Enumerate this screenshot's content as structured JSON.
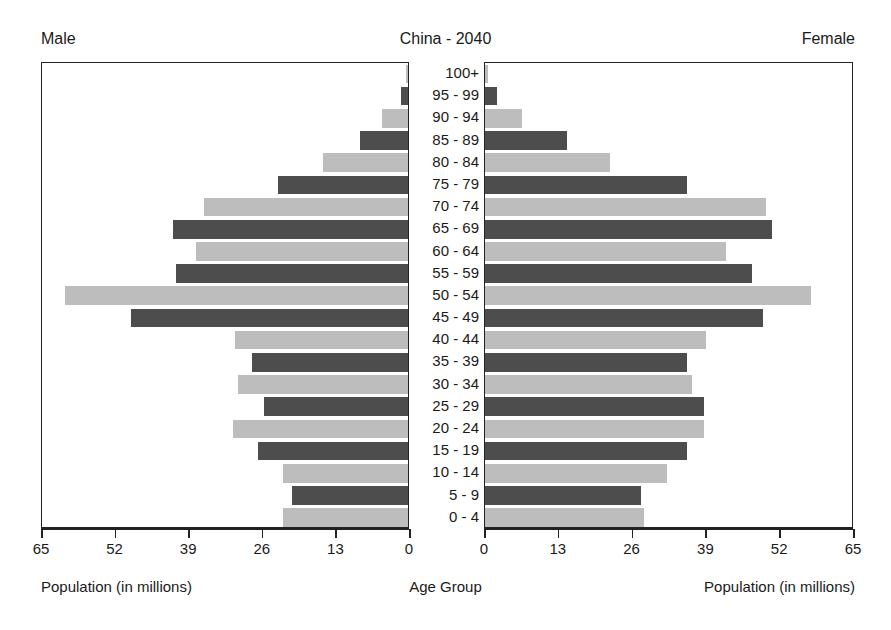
{
  "header": {
    "male_label": "Male",
    "female_label": "Female",
    "title": "China - 2040"
  },
  "footer": {
    "left_caption": "Population (in millions)",
    "center_caption": "Age Group",
    "right_caption": "Population (in millions)"
  },
  "colors": {
    "bar_dark": "#4d4d4d",
    "bar_light": "#bdbdbd",
    "axis": "#222222",
    "text": "#1a1a1a",
    "background": "#ffffff"
  },
  "axis": {
    "left_ticks": [
      "65",
      "52",
      "39",
      "26",
      "13",
      "0"
    ],
    "right_ticks": [
      "0",
      "13",
      "26",
      "39",
      "52",
      "65"
    ],
    "max": 65,
    "tick_step": 13
  },
  "chart_data": {
    "type": "bar",
    "subtype": "population-pyramid",
    "title": "China - 2040",
    "xlabel": "Population (in millions)",
    "ylabel": "Age Group",
    "xlim": [
      0,
      65
    ],
    "grid": false,
    "legend": [
      "Male",
      "Female"
    ],
    "legend_position": "top-corners",
    "categories": [
      "100+",
      "95 - 99",
      "90 - 94",
      "85 - 89",
      "80 - 84",
      "75 - 79",
      "70 - 74",
      "65 - 69",
      "60 - 64",
      "55 - 59",
      "50 - 54",
      "45 - 49",
      "40 - 44",
      "35 - 39",
      "30 - 34",
      "25 - 29",
      "20 - 24",
      "15 - 19",
      "10 - 14",
      "5 - 9",
      "0 - 4"
    ],
    "series": [
      {
        "name": "Male",
        "side": "left",
        "values": [
          0.4,
          1.3,
          4.6,
          8.5,
          15.1,
          23.0,
          36.0,
          41.5,
          37.5,
          41.0,
          60.5,
          49.0,
          30.5,
          27.5,
          30.0,
          25.5,
          31.0,
          26.5,
          22.0,
          20.5,
          22.0
        ]
      },
      {
        "name": "Female",
        "side": "right",
        "values": [
          0.5,
          2.2,
          6.5,
          14.5,
          22.0,
          35.5,
          49.5,
          50.5,
          42.5,
          47.0,
          57.5,
          49.0,
          39.0,
          35.5,
          36.5,
          38.5,
          38.5,
          35.5,
          32.0,
          27.5,
          28.0
        ]
      }
    ]
  }
}
